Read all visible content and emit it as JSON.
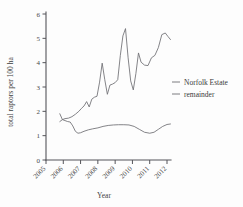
{
  "chart_data": {
    "type": "line",
    "title": "",
    "xlabel": "Year",
    "ylabel": "total raptors per 100 ha",
    "xlim": [
      2005,
      2012
    ],
    "ylim": [
      0,
      6
    ],
    "grid": false,
    "legend_position": "right",
    "x_tick_labels": [
      "2005",
      "2006",
      "2007",
      "2008",
      "2009",
      "2010",
      "2011",
      "2012"
    ],
    "y_tick_labels": [
      "0",
      "1",
      "2",
      "3",
      "4",
      "5",
      "6"
    ],
    "y_ticks": [
      0,
      1,
      2,
      3,
      4,
      5,
      6
    ],
    "series": [
      {
        "name": "Norfolk Estate",
        "color": "#6e6e72",
        "x": [
          2005.8,
          2005.95,
          2006.1,
          2006.3,
          2006.5,
          2006.7,
          2006.9,
          2007.05,
          2007.2,
          2007.35,
          2007.5,
          2007.65,
          2007.8,
          2007.95,
          2008.1,
          2008.25,
          2008.4,
          2008.55,
          2008.7,
          2008.85,
          2009.0,
          2009.15,
          2009.3,
          2009.45,
          2009.6,
          2009.75,
          2009.9,
          2010.05,
          2010.2,
          2010.35,
          2010.5,
          2010.7,
          2010.9,
          2011.1,
          2011.3,
          2011.5,
          2011.7,
          2011.9,
          2012.05,
          2012.2
        ],
        "y": [
          1.9,
          1.66,
          1.7,
          1.72,
          1.78,
          1.88,
          2.0,
          2.12,
          2.22,
          2.4,
          2.18,
          2.5,
          2.58,
          2.62,
          3.2,
          3.98,
          3.3,
          2.7,
          3.08,
          3.12,
          3.18,
          3.3,
          4.3,
          5.1,
          5.4,
          4.2,
          3.25,
          2.88,
          3.55,
          4.4,
          4.02,
          3.9,
          3.88,
          4.2,
          4.3,
          4.62,
          5.15,
          5.22,
          5.08,
          4.95
        ]
      },
      {
        "name": "remainder",
        "color": "#6e6e72",
        "x": [
          2005.8,
          2005.95,
          2006.1,
          2006.25,
          2006.4,
          2006.55,
          2006.7,
          2006.85,
          2007.0,
          2007.2,
          2007.45,
          2007.7,
          2008.0,
          2008.3,
          2008.6,
          2008.9,
          2009.2,
          2009.5,
          2009.8,
          2010.1,
          2010.4,
          2010.7,
          2011.0,
          2011.25,
          2011.5,
          2011.75,
          2012.0,
          2012.2
        ],
        "y": [
          1.58,
          1.66,
          1.62,
          1.58,
          1.56,
          1.4,
          1.18,
          1.1,
          1.12,
          1.18,
          1.24,
          1.28,
          1.32,
          1.38,
          1.42,
          1.44,
          1.45,
          1.45,
          1.44,
          1.38,
          1.26,
          1.14,
          1.1,
          1.14,
          1.26,
          1.38,
          1.46,
          1.48
        ]
      }
    ]
  },
  "legend": {
    "items": [
      {
        "label": "Norfolk Estate"
      },
      {
        "label": "remainder"
      }
    ]
  },
  "axes": {
    "x_title": "Year",
    "y_title": "total raptors per 100 ha"
  }
}
